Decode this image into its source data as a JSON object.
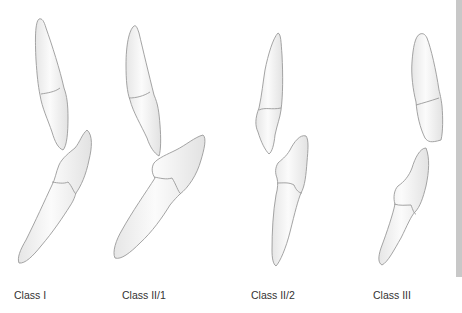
{
  "figure": {
    "type": "dental-occlusion-diagram",
    "panels": [
      {
        "id": "class-1",
        "label": "Class I"
      },
      {
        "id": "class-2-1",
        "label": "Class II/1"
      },
      {
        "id": "class-2-2",
        "label": "Class II/2"
      },
      {
        "id": "class-3",
        "label": "Class III"
      }
    ]
  },
  "colors": {
    "tooth_fill_light": "#fbfbfb",
    "tooth_fill_shade": "#e4e4e4",
    "outline": "#9a9a9a",
    "label_text": "#333333",
    "side_bar": "#c8c8c8"
  }
}
